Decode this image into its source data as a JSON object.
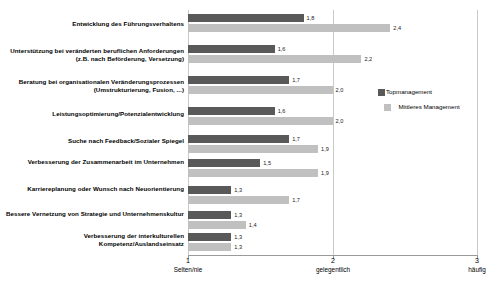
{
  "chart_data": {
    "type": "bar",
    "orientation": "horizontal",
    "title": "",
    "xlabel": "",
    "ylabel": "",
    "xlim": [
      1,
      3
    ],
    "grid": true,
    "legend_position": "right",
    "categories": [
      "Entwicklung des Führungsverhaltens",
      "Unterstützung bei veränderten beruflichen Anforderungen (z.B. nach Beförderung, Versetzung)",
      "Beratung bei organisationalen Veränderungsprozessen (Umstrukturierung, Fusion, ...)",
      "Leistungsoptimierung/Potenzialentwicklung",
      "Suche nach Feedback/Sozialer Spiegel",
      "Verbesserung der Zusammenarbeit im Unternehmen",
      "Karriereplanung oder Wunsch nach Neuorientierung",
      "Bessere Vernetzung von Strategie und Unternehmenskultur",
      "Verbesserung der interkulturellen Kompetenz/Auslandseinsatz"
    ],
    "series": [
      {
        "name": "Topmanagement",
        "color": "#595959",
        "values": [
          1.8,
          1.6,
          1.7,
          1.6,
          1.7,
          1.5,
          1.3,
          1.3,
          1.3
        ],
        "value_labels": [
          "1,8",
          "1,6",
          "1,7",
          "1,6",
          "1,7",
          "1,5",
          "1,3",
          "1,3",
          "1,3"
        ]
      },
      {
        "name": "Mittleres Management",
        "color": "#c0c0c0",
        "values": [
          2.4,
          2.2,
          2.0,
          2.0,
          1.9,
          1.9,
          1.7,
          1.4,
          1.3
        ],
        "value_labels": [
          "2,4",
          "2,2",
          "2,0",
          "2,0",
          "1,9",
          "1,9",
          "1,7",
          "1,4",
          "1,3"
        ]
      }
    ],
    "x_ticks": [
      {
        "value": 1,
        "number": "1",
        "caption": "Selten/nie"
      },
      {
        "value": 2,
        "number": "2",
        "caption": "gelegentlich"
      },
      {
        "value": 3,
        "number": "3",
        "caption": "häufig"
      }
    ]
  },
  "legend": {
    "items": [
      {
        "label": "Topmanagement",
        "color": "#595959"
      },
      {
        "label": "Mittleres Management",
        "color": "#c0c0c0"
      }
    ]
  }
}
